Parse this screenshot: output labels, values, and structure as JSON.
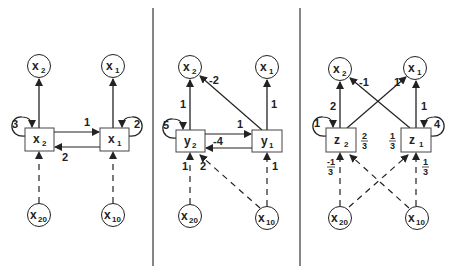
{
  "panels": [
    {
      "id": "left",
      "top_nodes": [
        {
          "var": "x",
          "sub": "2",
          "label": "x2"
        },
        {
          "var": "x",
          "sub": "1",
          "label": "x1"
        }
      ],
      "boxes": [
        {
          "var": "x",
          "sub": "2",
          "self_loop": "3"
        },
        {
          "var": "x",
          "sub": "1",
          "self_loop": "2"
        }
      ],
      "bottom_nodes": [
        {
          "var": "x",
          "sub": "20"
        },
        {
          "var": "x",
          "sub": "10"
        }
      ],
      "edges": {
        "box2_to_top2": "",
        "box1_to_top1": "",
        "box2_to_box1": "1",
        "box1_to_box2": "2"
      }
    },
    {
      "id": "middle",
      "top_nodes": [
        {
          "var": "x",
          "sub": "2"
        },
        {
          "var": "x",
          "sub": "1"
        }
      ],
      "boxes": [
        {
          "var": "y",
          "sub": "2",
          "self_loop": "5"
        },
        {
          "var": "y",
          "sub": "1",
          "self_loop": ""
        }
      ],
      "bottom_nodes": [
        {
          "var": "x",
          "sub": "20"
        },
        {
          "var": "x",
          "sub": "10"
        }
      ],
      "edges": {
        "box2_to_top2": "1",
        "box1_to_top1": "1",
        "box1_to_top2": "-2",
        "box2_to_box1": "1",
        "box1_to_box2": "-4",
        "bottom20_to_box2": "1",
        "bottom10_to_box2": "2",
        "bottom10_to_box1": "1"
      }
    },
    {
      "id": "right",
      "top_nodes": [
        {
          "var": "x",
          "sub": "2"
        },
        {
          "var": "x",
          "sub": "1"
        }
      ],
      "boxes": [
        {
          "var": "z",
          "sub": "2",
          "self_loop": "1"
        },
        {
          "var": "z",
          "sub": "1",
          "self_loop": "4"
        }
      ],
      "bottom_nodes": [
        {
          "var": "x",
          "sub": "20"
        },
        {
          "var": "x",
          "sub": "10"
        }
      ],
      "edges": {
        "box2_to_top2": "2",
        "box1_to_top1": "1",
        "box1_to_top2": "-1",
        "box2_to_top1": "1",
        "box2_weight_num": "2",
        "box2_weight_den": "3",
        "box1_weight_num": "1",
        "box1_weight_den": "3",
        "bottom20_to_box2_num": "-1",
        "bottom20_to_box2_den": "3",
        "bottom10_to_box1_num": "1",
        "bottom10_to_box1_den": "3"
      }
    }
  ]
}
